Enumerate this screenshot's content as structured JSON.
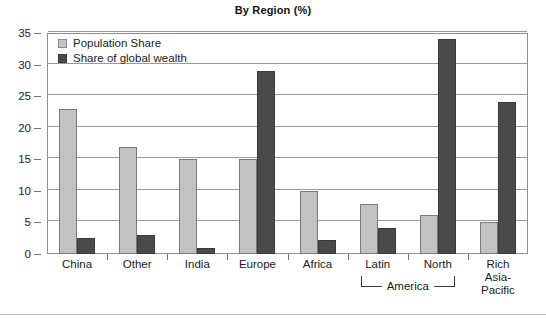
{
  "chart_data": {
    "type": "bar",
    "title": "By Region (%)",
    "xlabel": "",
    "ylabel": "",
    "ylim": [
      0,
      35
    ],
    "yticks": [
      0,
      5,
      10,
      15,
      20,
      25,
      30,
      35
    ],
    "grid": true,
    "legend_position": "top-left",
    "categories": [
      "China",
      "Other",
      "India",
      "Europe",
      "Africa",
      "Latin",
      "North",
      "Rich Asia-Pacific"
    ],
    "category_lines": [
      [
        "China"
      ],
      [
        "Other"
      ],
      [
        "India"
      ],
      [
        "Europe"
      ],
      [
        "Africa"
      ],
      [
        "Latin"
      ],
      [
        "North"
      ],
      [
        "Rich",
        "Asia-",
        "Pacific"
      ]
    ],
    "group_annotation": {
      "label": "America",
      "spans": [
        "Latin",
        "North"
      ]
    },
    "series": [
      {
        "name": "Population Share",
        "color": "#c2c2c2",
        "values": [
          23,
          17,
          15,
          15,
          10,
          8,
          6.2,
          5
        ]
      },
      {
        "name": "Share of global wealth",
        "color": "#4a4a4a",
        "values": [
          2.5,
          3,
          1,
          29,
          2.2,
          4.1,
          34,
          24
        ]
      }
    ]
  },
  "legend": {
    "items": [
      {
        "label": "Population Share",
        "swatch": "light-gray-swatch"
      },
      {
        "label": "Share of global wealth",
        "swatch": "dark-gray-swatch"
      }
    ]
  },
  "colors": {
    "population_share": "#c2c2c2",
    "global_wealth": "#4a4a4a",
    "gridline": "#9a9a9a",
    "frame": "#8d8d8d",
    "text": "#1a1a1a"
  }
}
